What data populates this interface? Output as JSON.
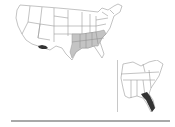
{
  "map": {
    "type": "choropleth",
    "region": "United States",
    "colors": {
      "background": "#ffffff",
      "state_fill": "#ffffff",
      "state_border": "#9a9a9a",
      "light_shade": "#c4c4c4",
      "dark_shade": "#333333",
      "rule": "#a9a9a9"
    },
    "light_shaded_states": [
      "Texas (east)",
      "Oklahoma (east)",
      "Arkansas",
      "Louisiana",
      "Missouri (south)",
      "Tennessee",
      "Mississippi",
      "Alabama",
      "Georgia",
      "Kentucky (south)",
      "South Carolina",
      "North Carolina"
    ],
    "dark_shaded_regions": [
      "Southern Arizona / New Mexico border"
    ],
    "inset": {
      "region": "Southeastern United States",
      "dark_shaded_regions": [
        "Florida"
      ]
    }
  }
}
